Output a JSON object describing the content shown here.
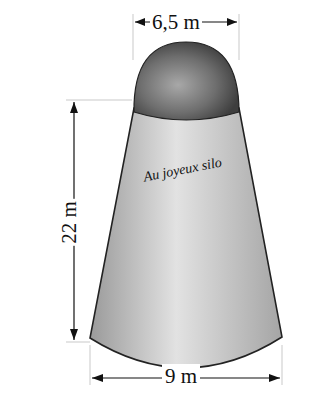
{
  "figure": {
    "top_diameter_label": "6,5 m",
    "bottom_diameter_label": "9 m",
    "height_label": "22 m",
    "silo_name": "Au joyeux silo"
  }
}
